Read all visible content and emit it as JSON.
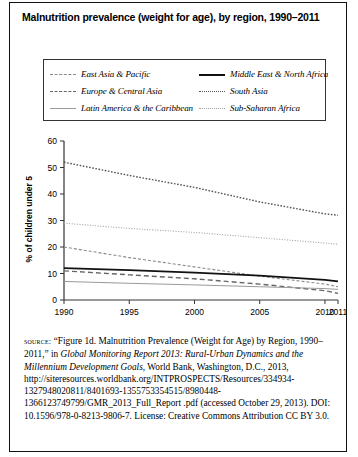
{
  "title": "Malnutrition prevalence (weight for age), by region, 1990–2011",
  "legend": {
    "left": [
      {
        "label": "East Asia & Pacific",
        "key": "eap",
        "style": "dashed-fine",
        "color": "#8a8a8a"
      },
      {
        "label": "Europe & Central Asia",
        "key": "eca",
        "style": "dashed",
        "color": "#666666"
      },
      {
        "label": "Latin America & the Caribbean",
        "key": "lac",
        "style": "solid-thin",
        "color": "#9a9a9a"
      }
    ],
    "right": [
      {
        "label": "Middle East & North Africa",
        "key": "mena",
        "style": "solid-thick",
        "color": "#111111"
      },
      {
        "label": "South Asia",
        "key": "sa",
        "style": "dotted",
        "color": "#555555"
      },
      {
        "label": "Sub-Saharan Africa",
        "key": "ssa",
        "style": "dotted-fine",
        "color": "#a0a0a0"
      }
    ]
  },
  "chart_data": {
    "type": "line",
    "title": "Malnutrition prevalence (weight for age), by region, 1990–2011",
    "xlabel": "",
    "ylabel": "% of children under 5",
    "xlim": [
      1990,
      2011
    ],
    "ylim": [
      0,
      60
    ],
    "yticks": [
      0,
      10,
      20,
      30,
      40,
      50,
      60
    ],
    "xticks": [
      1990,
      1995,
      2000,
      2005,
      2010,
      2011
    ],
    "grid": false,
    "legend_position": "top",
    "x": [
      1990,
      1995,
      2000,
      2005,
      2010,
      2011
    ],
    "series": [
      {
        "name": "South Asia",
        "key": "sa",
        "values": [
          52.0,
          47.0,
          42.5,
          37.0,
          32.5,
          32.0
        ]
      },
      {
        "name": "Sub-Saharan Africa",
        "key": "ssa",
        "values": [
          29.0,
          27.0,
          25.5,
          23.5,
          21.5,
          21.0
        ]
      },
      {
        "name": "East Asia & Pacific",
        "key": "eap",
        "values": [
          20.0,
          16.0,
          12.5,
          9.0,
          6.0,
          5.0
        ]
      },
      {
        "name": "Middle East & North Africa",
        "key": "mena",
        "values": [
          12.0,
          11.3,
          10.3,
          9.2,
          7.6,
          7.0
        ]
      },
      {
        "name": "Europe & Central Asia",
        "key": "eca",
        "values": [
          11.0,
          9.5,
          8.0,
          6.0,
          3.5,
          2.5
        ]
      },
      {
        "name": "Latin America & the Caribbean",
        "key": "lac",
        "values": [
          7.0,
          6.3,
          5.7,
          5.0,
          4.3,
          4.0
        ]
      }
    ]
  },
  "source": {
    "label": "source:",
    "text_1": " “Figure 1d. Malnutrition Prevalence (Weight for Age) by Region, 1990–2011,” in ",
    "italic_1": "Global Monitoring Report 2013: Rural-Urban Dynamics and the Millennium Development Goals",
    "text_2": ", World Bank, Washington, D.C., 2013, http://siteresources.worldbank.org/INTPROSPECTS/Resources/334934-1327948020811/8401693-1355753354515/8980448-1366123749799/GMR_2013_Full_Report .pdf (accessed October 29, 2013). DOI: 10.1596/978-0-8213-9806-7. License: Creative Commons Attribution CC BY 3.0."
  }
}
